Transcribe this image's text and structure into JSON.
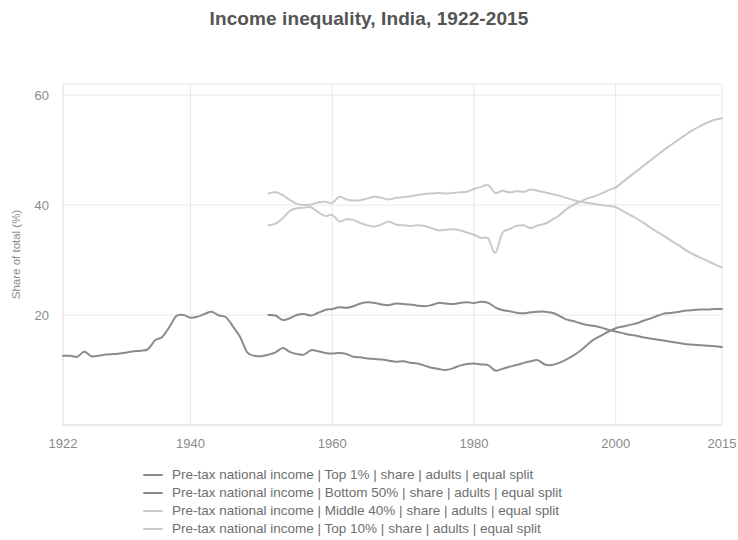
{
  "chart_data": {
    "type": "line",
    "title": "Income inequality, India, 1922-2015",
    "xlabel": "",
    "ylabel": "Share of total (%)",
    "xlim": [
      1922,
      2015
    ],
    "ylim": [
      0,
      62
    ],
    "xticks": [
      "1922",
      "1940",
      "1960",
      "1980",
      "2000",
      "2015"
    ],
    "xtick_values": [
      1922,
      1940,
      1960,
      1980,
      2000,
      2015
    ],
    "yticks": [
      "20",
      "40",
      "60"
    ],
    "ytick_values": [
      20,
      40,
      60
    ],
    "grid": true,
    "legend_position": "bottom",
    "colors": {
      "top1": "#8c8c8c",
      "bottom50": "#8a8a8a",
      "middle40": "#c9c9c9",
      "top10": "#c9c9c9",
      "grid": "#e8e8e8",
      "text": "#8a8a8a",
      "title": "#545454"
    },
    "series": [
      {
        "name": "Pre-tax national income | Top 1% | share | adults | equal split",
        "short_name": "Top 1%",
        "color": "#8c8c8c",
        "x": [
          1922,
          1923,
          1924,
          1925,
          1926,
          1927,
          1928,
          1929,
          1930,
          1931,
          1932,
          1933,
          1934,
          1935,
          1936,
          1937,
          1938,
          1939,
          1940,
          1941,
          1942,
          1943,
          1944,
          1945,
          1946,
          1947,
          1948,
          1949,
          1950,
          1951,
          1952,
          1953,
          1954,
          1955,
          1956,
          1957,
          1958,
          1959,
          1960,
          1961,
          1962,
          1963,
          1964,
          1965,
          1966,
          1967,
          1968,
          1969,
          1970,
          1971,
          1972,
          1973,
          1974,
          1975,
          1976,
          1977,
          1978,
          1979,
          1980,
          1981,
          1982,
          1983,
          1984,
          1985,
          1986,
          1987,
          1988,
          1989,
          1990,
          1991,
          1992,
          1993,
          1994,
          1995,
          1996,
          1997,
          1998,
          1999,
          2000,
          2001,
          2002,
          2003,
          2004,
          2005,
          2006,
          2007,
          2008,
          2009,
          2010,
          2011,
          2012,
          2013,
          2014,
          2015
        ],
        "y": [
          12.6,
          12.6,
          12.4,
          13.3,
          12.5,
          12.6,
          12.8,
          12.9,
          13.0,
          13.2,
          13.4,
          13.5,
          13.8,
          15.4,
          16.0,
          17.8,
          19.8,
          20.0,
          19.5,
          19.7,
          20.2,
          20.6,
          19.9,
          19.6,
          17.9,
          16.0,
          13.2,
          12.6,
          12.5,
          12.8,
          13.2,
          14.0,
          13.3,
          12.9,
          12.8,
          13.6,
          13.4,
          13.1,
          13.0,
          13.1,
          12.9,
          12.4,
          12.3,
          12.1,
          12.0,
          11.9,
          11.7,
          11.5,
          11.6,
          11.3,
          11.2,
          10.8,
          10.4,
          10.2,
          10.0,
          10.3,
          10.8,
          11.1,
          11.2,
          11.0,
          10.9,
          9.9,
          10.2,
          10.6,
          10.9,
          11.3,
          11.6,
          11.8,
          11.0,
          10.9,
          11.3,
          11.9,
          12.6,
          13.5,
          14.6,
          15.6,
          16.3,
          17.0,
          17.6,
          17.9,
          18.2,
          18.5,
          19.0,
          19.4,
          19.9,
          20.3,
          20.4,
          20.6,
          20.8,
          20.9,
          21.0,
          21.0,
          21.1,
          21.1
        ]
      },
      {
        "name": "Pre-tax national income | Bottom 50% | share | adults | equal split",
        "short_name": "Bottom 50%",
        "color": "#8a8a8a",
        "x": [
          1951,
          1952,
          1953,
          1954,
          1955,
          1956,
          1957,
          1958,
          1959,
          1960,
          1961,
          1962,
          1963,
          1964,
          1965,
          1966,
          1967,
          1968,
          1969,
          1970,
          1971,
          1972,
          1973,
          1974,
          1975,
          1976,
          1977,
          1978,
          1979,
          1980,
          1981,
          1982,
          1983,
          1984,
          1985,
          1986,
          1987,
          1988,
          1989,
          1990,
          1991,
          1992,
          1993,
          1994,
          1995,
          1996,
          1997,
          1998,
          1999,
          2000,
          2001,
          2002,
          2003,
          2004,
          2005,
          2006,
          2007,
          2008,
          2009,
          2010,
          2011,
          2012,
          2013,
          2014,
          2015
        ],
        "y": [
          20.0,
          19.9,
          19.1,
          19.4,
          20.0,
          20.2,
          19.9,
          20.4,
          20.9,
          21.1,
          21.4,
          21.3,
          21.6,
          22.1,
          22.3,
          22.2,
          21.9,
          21.8,
          22.1,
          22.0,
          21.9,
          21.7,
          21.6,
          21.8,
          22.2,
          22.1,
          22.0,
          22.2,
          22.3,
          22.2,
          22.4,
          22.2,
          21.4,
          20.9,
          20.7,
          20.4,
          20.3,
          20.5,
          20.6,
          20.6,
          20.4,
          19.9,
          19.2,
          18.9,
          18.5,
          18.2,
          18.0,
          17.7,
          17.3,
          17.0,
          16.7,
          16.4,
          16.2,
          15.9,
          15.7,
          15.5,
          15.3,
          15.1,
          14.9,
          14.7,
          14.6,
          14.5,
          14.4,
          14.3,
          14.2
        ]
      },
      {
        "name": "Pre-tax national income | Middle 40% | share | adults | equal split",
        "short_name": "Middle 40%",
        "color": "#c9c9c9",
        "x": [
          1951,
          1952,
          1953,
          1954,
          1955,
          1956,
          1957,
          1958,
          1959,
          1960,
          1961,
          1962,
          1963,
          1964,
          1965,
          1966,
          1967,
          1968,
          1969,
          1970,
          1971,
          1972,
          1973,
          1974,
          1975,
          1976,
          1977,
          1978,
          1979,
          1980,
          1981,
          1982,
          1983,
          1984,
          1985,
          1986,
          1987,
          1988,
          1989,
          1990,
          1991,
          1992,
          1993,
          1994,
          1995,
          1996,
          1997,
          1998,
          1999,
          2000,
          2001,
          2002,
          2003,
          2004,
          2005,
          2006,
          2007,
          2008,
          2009,
          2010,
          2011,
          2012,
          2013,
          2014,
          2015
        ],
        "y": [
          42.1,
          42.3,
          41.8,
          40.9,
          40.2,
          40.0,
          40.1,
          40.5,
          40.6,
          40.4,
          41.5,
          41.0,
          40.8,
          40.9,
          41.2,
          41.5,
          41.3,
          41.0,
          41.3,
          41.4,
          41.6,
          41.8,
          42.0,
          42.1,
          42.2,
          42.1,
          42.2,
          42.3,
          42.4,
          42.9,
          43.3,
          43.6,
          42.2,
          42.6,
          42.3,
          42.5,
          42.4,
          42.8,
          42.6,
          42.3,
          42.0,
          41.7,
          41.3,
          40.9,
          40.6,
          40.4,
          40.2,
          40.0,
          39.8,
          39.6,
          38.9,
          38.2,
          37.5,
          36.7,
          35.8,
          35.0,
          34.2,
          33.4,
          32.6,
          31.7,
          31.0,
          30.4,
          29.8,
          29.2,
          28.6
        ]
      },
      {
        "name": "Pre-tax national income | Top 10% | share | adults | equal split",
        "short_name": "Top 10%",
        "color": "#c9c9c9",
        "x": [
          1951,
          1952,
          1953,
          1954,
          1955,
          1956,
          1957,
          1958,
          1959,
          1960,
          1961,
          1962,
          1963,
          1964,
          1965,
          1966,
          1967,
          1968,
          1969,
          1970,
          1971,
          1972,
          1973,
          1974,
          1975,
          1976,
          1977,
          1978,
          1979,
          1980,
          1981,
          1982,
          1983,
          1984,
          1985,
          1986,
          1987,
          1988,
          1989,
          1990,
          1991,
          1992,
          1993,
          1994,
          1995,
          1996,
          1997,
          1998,
          1999,
          2000,
          2001,
          2002,
          2003,
          2004,
          2005,
          2006,
          2007,
          2008,
          2009,
          2010,
          2011,
          2012,
          2013,
          2014,
          2015
        ],
        "y": [
          36.3,
          36.6,
          37.6,
          38.9,
          39.4,
          39.5,
          39.6,
          38.7,
          38.0,
          38.2,
          37.0,
          37.4,
          37.3,
          36.7,
          36.3,
          36.1,
          36.5,
          37.0,
          36.4,
          36.3,
          36.2,
          36.3,
          36.2,
          35.8,
          35.4,
          35.5,
          35.6,
          35.4,
          35.0,
          34.6,
          34.0,
          33.9,
          31.3,
          34.9,
          35.6,
          36.2,
          36.3,
          35.8,
          36.3,
          36.6,
          37.3,
          38.1,
          39.2,
          40.0,
          40.6,
          41.2,
          41.6,
          42.1,
          42.7,
          43.2,
          44.2,
          45.2,
          46.2,
          47.2,
          48.2,
          49.2,
          50.2,
          51.1,
          52.0,
          52.9,
          53.7,
          54.4,
          55.0,
          55.5,
          55.8
        ]
      }
    ]
  },
  "legend": {
    "entries": [
      {
        "label": "Pre-tax national income | Top 1% | share | adults | equal split",
        "color": "#8c8c8c"
      },
      {
        "label": "Pre-tax national income | Bottom 50% | share | adults | equal split",
        "color": "#8a8a8a"
      },
      {
        "label": "Pre-tax national income | Middle 40% | share | adults | equal split",
        "color": "#c9c9c9"
      },
      {
        "label": "Pre-tax national income | Top 10% | share | adults | equal split",
        "color": "#c9c9c9"
      }
    ]
  }
}
